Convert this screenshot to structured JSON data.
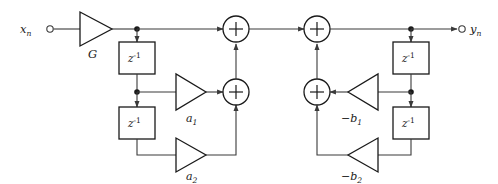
{
  "diagram": {
    "input": {
      "label_base": "x",
      "label_sub": "n",
      "port_name": "input-port"
    },
    "output": {
      "label_base": "y",
      "label_sub": "n",
      "port_name": "output-port"
    },
    "gain_input": {
      "label": "G"
    },
    "delays": [
      {
        "id": "delay-ff-1",
        "base": "z",
        "exp": "-1"
      },
      {
        "id": "delay-ff-2",
        "base": "z",
        "exp": "-1"
      },
      {
        "id": "delay-fb-1",
        "base": "z",
        "exp": "-1"
      },
      {
        "id": "delay-fb-2",
        "base": "z",
        "exp": "-1"
      }
    ],
    "coefficients": [
      {
        "id": "gain-a1",
        "base": "a",
        "sub": "1",
        "sign": ""
      },
      {
        "id": "gain-a2",
        "base": "a",
        "sub": "2",
        "sign": ""
      },
      {
        "id": "gain-b1",
        "base": "b",
        "sub": "1",
        "sign": "−"
      },
      {
        "id": "gain-b2",
        "base": "b",
        "sub": "2",
        "sign": "−"
      }
    ],
    "adders": [
      {
        "id": "adder-top-left",
        "symbol": "+"
      },
      {
        "id": "adder-top-right",
        "symbol": "+"
      },
      {
        "id": "adder-mid-left",
        "symbol": "+"
      },
      {
        "id": "adder-mid-right",
        "symbol": "+"
      }
    ],
    "colors": {
      "wire": "#3a3a3a",
      "outline": "#1a1a1a",
      "background": "#ffffff",
      "node": "#1a1a1a"
    }
  }
}
